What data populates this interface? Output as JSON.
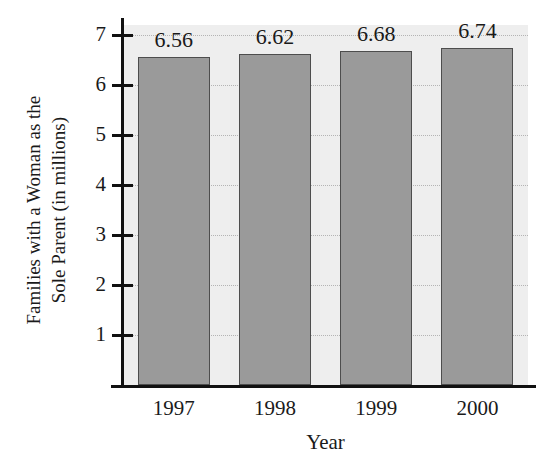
{
  "chart_data": {
    "type": "bar",
    "title": "",
    "xlabel": "Year",
    "ylabel": "Families with a Woman as the Sole Parent (in millions)",
    "ylabel_line1": "Families with a Woman as the",
    "ylabel_line2": "Sole Parent (in millions)",
    "categories": [
      "1997",
      "1998",
      "1999",
      "2000"
    ],
    "values": [
      6.56,
      6.62,
      6.68,
      6.74
    ],
    "data_labels": [
      "6.56",
      "6.62",
      "6.68",
      "6.74"
    ],
    "ylim": [
      0,
      7.2
    ],
    "y_ticks": [
      7,
      6,
      5,
      4,
      3,
      2,
      1
    ],
    "y_tick_labels": [
      "7",
      "6",
      "5",
      "4",
      "3",
      "2",
      "1"
    ],
    "grid": true,
    "grid_axis": "y",
    "legend": false,
    "legend_position": "none",
    "colors": {
      "bar_fill": "#9a9a9a",
      "bar_edge": "#4d4d4d",
      "plot_background": "#eeeeee",
      "figure_background": "#ffffff",
      "gridline": "#b4b4b4",
      "axis": "#111111",
      "text": "#1a1a1a"
    }
  }
}
